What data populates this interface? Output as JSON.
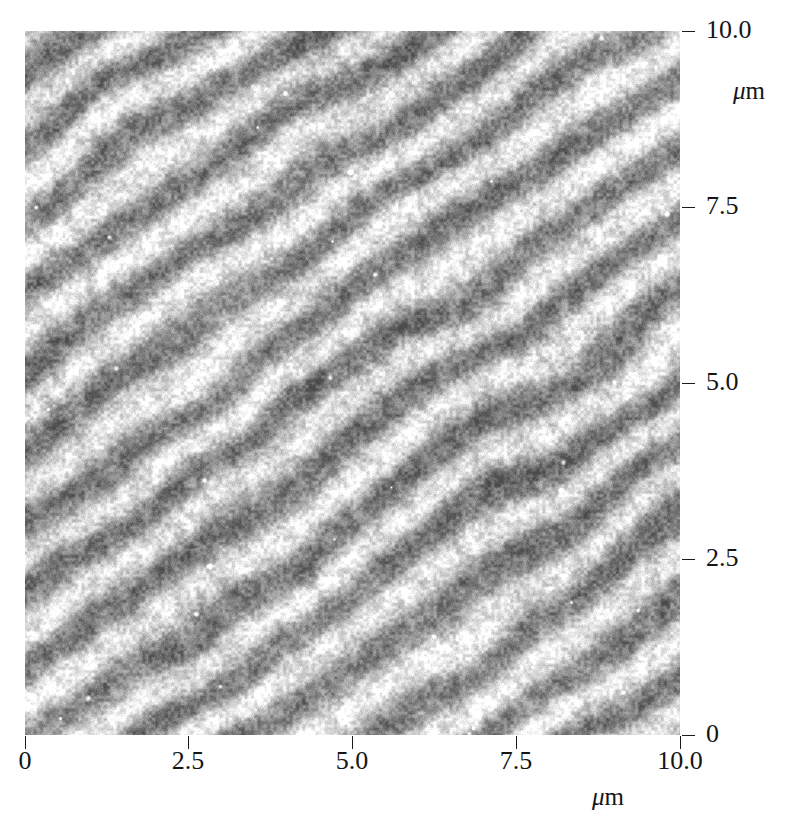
{
  "figure": {
    "image_type": "grayscale-micrograph"
  },
  "chart_data": {
    "type": "heatmap",
    "title": "",
    "subtitle": "",
    "xlabel": "μm",
    "ylabel": "μm",
    "xlim": [
      0,
      10
    ],
    "ylim": [
      0,
      10
    ],
    "grid": false,
    "legend": "none",
    "colormap": "grayscale",
    "value_range_gray": [
      "#6e6e6e",
      "#ffffff"
    ],
    "x_ticks": [
      0,
      2.5,
      5.0,
      7.5,
      10.0
    ],
    "y_ticks": [
      0,
      2.5,
      5.0,
      7.5,
      10.0
    ],
    "x_tick_labels": [
      "0",
      "2.5",
      "5.0",
      "7.5",
      "10.0"
    ],
    "y_tick_labels": [
      "0",
      "2.5",
      "5.0",
      "7.5",
      "10.0"
    ],
    "pattern": {
      "description": "Parallel diagonal stripes descending left-to-right with grainy speckle noise and scattered bright particulates",
      "orientation_deg": -34,
      "period_um": 1.62,
      "period_px_vertical": 75,
      "period_px_horizontal": 110,
      "stripe_count_visible": 11,
      "noise": "fine granular",
      "bright_specks": 38
    }
  },
  "axes": {
    "right": {
      "unit": "μm",
      "unit_mu": "μ",
      "unit_m": "m",
      "ticks": [
        {
          "label": "10.0",
          "value": 10.0,
          "y": 31
        },
        {
          "label": "7.5",
          "value": 7.5,
          "y": 207
        },
        {
          "label": "5.0",
          "value": 5.0,
          "y": 383
        },
        {
          "label": "2.5",
          "value": 2.5,
          "y": 559
        },
        {
          "label": "0",
          "value": 0,
          "y": 735
        }
      ]
    },
    "bottom": {
      "unit": "μm",
      "unit_mu": "μ",
      "unit_m": "m",
      "ticks": [
        {
          "label": "0",
          "value": 0,
          "x": 25
        },
        {
          "label": "2.5",
          "value": 2.5,
          "x": 188
        },
        {
          "label": "5.0",
          "value": 5.0,
          "x": 352
        },
        {
          "label": "7.5",
          "value": 7.5,
          "x": 516
        },
        {
          "label": "10.0",
          "value": 10.0,
          "x": 680
        }
      ]
    }
  }
}
